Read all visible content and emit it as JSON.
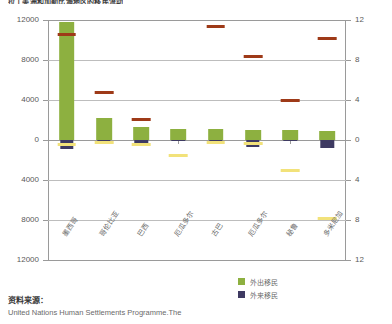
{
  "title": "拉丁美洲和加勒比海地区的移民流动",
  "legend": {
    "items": [
      {
        "label": "外出移民",
        "color": "#8DB040"
      },
      {
        "label": "外来移民",
        "color": "#3E3A62"
      }
    ]
  },
  "footer": {
    "heading": "资料来源：",
    "body": "United Nations Human Settlements Programme.The"
  },
  "chart_data": {
    "type": "bar",
    "title": "拉丁美洲和加勒比海地区的移民流动",
    "xlabel": "",
    "ylabel": "",
    "grid": true,
    "legend_position": "bottom-right",
    "categories": [
      "墨西哥",
      "哥伦比亚",
      "巴西",
      "厄瓜多尔",
      "古巴",
      "厄瓜多尔",
      "秘鲁",
      "多米尼加"
    ],
    "y_left": {
      "ticks": [
        12000,
        8000,
        4000,
        0,
        4000,
        8000,
        12000
      ],
      "ylim": [
        -12000,
        12000
      ]
    },
    "y_right": {
      "ticks": [
        12,
        8,
        4,
        0,
        4,
        8,
        12
      ],
      "ylim": [
        -12,
        12
      ]
    },
    "series": [
      {
        "name": "外出移民",
        "color": "#8DB040",
        "axis": "left",
        "values": [
          11800,
          2200,
          1300,
          1150,
          1100,
          1050,
          1000,
          900
        ]
      },
      {
        "name": "外来移民",
        "color": "#3E3A62",
        "axis": "left",
        "values": [
          -900,
          -150,
          -600,
          -120,
          -100,
          -700,
          -120,
          -800
        ]
      },
      {
        "name": "外出移民比例",
        "color": "#9E3A18",
        "axis": "right",
        "values": [
          10.6,
          4.8,
          2.1,
          null,
          11.4,
          8.4,
          4.0,
          10.2
        ]
      },
      {
        "name": "外来移民比例",
        "color": "#F2E27A",
        "axis": "right",
        "values": [
          -0.4,
          -0.2,
          -0.4,
          -1.5,
          -0.2,
          -0.3,
          -3.0,
          -7.8
        ]
      }
    ]
  }
}
